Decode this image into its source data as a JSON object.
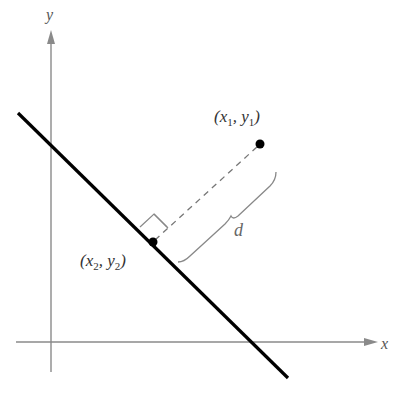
{
  "diagram": {
    "axes": {
      "x_label": "x",
      "y_label": "y"
    },
    "points": [
      {
        "id": "p1",
        "var": "x",
        "sub1": "1",
        "var2": "y",
        "sub2": "1",
        "open": "(",
        "comma": ", ",
        "close": ")",
        "description": "point off the line"
      },
      {
        "id": "p2",
        "var": "x",
        "sub1": "2",
        "var2": "y",
        "sub2": "2",
        "open": "(",
        "comma": ", ",
        "close": ")",
        "description": "foot of perpendicular on the line"
      }
    ],
    "distance_label": "d",
    "colors": {
      "line": "#000000",
      "axes": "#8a8a8a",
      "dashed": "#777777",
      "brace": "#888888",
      "text": "#333333"
    }
  }
}
